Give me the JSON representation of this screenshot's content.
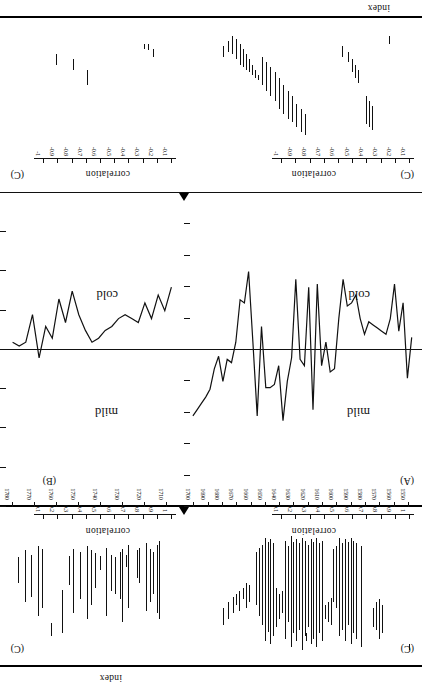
{
  "figure": {
    "orientation": "rotated-180",
    "panels": [
      {
        "id": "A",
        "label": "(A)"
      },
      {
        "id": "B",
        "label": "(B)"
      },
      {
        "id": "C1",
        "label": "(C)"
      },
      {
        "id": "C2",
        "label": "(C)"
      },
      {
        "id": "C3",
        "label": "(C)"
      },
      {
        "id": "C4",
        "label": "(C)"
      }
    ]
  },
  "axes": {
    "index_name": "index",
    "correlation_name": "correlation",
    "index_ticks": [
      "1",
      "0.8",
      "0.6",
      "0.4",
      "0.2",
      "0",
      "-0.2",
      "-0.4",
      "-0.6",
      "-0.8",
      "-1"
    ],
    "index_ticks_b": [
      "8",
      "6",
      "4",
      "2",
      "0",
      "-2",
      "-4",
      "-6",
      "-8"
    ],
    "corr_pos_ticks": [
      "1",
      "0.9",
      "0.8",
      "0.7",
      "0.6",
      "0.5",
      "0.4",
      "0.3",
      "0.2",
      "0.1"
    ],
    "corr_neg_ticks": [
      "-0.1",
      "-0.2",
      "-0.3",
      "-0.4",
      "-0.5",
      "-0.6",
      "-0.7",
      "-0.8",
      "-0.9",
      "-1"
    ],
    "years_a": [
      "1550",
      "1560",
      "1570",
      "1580",
      "1590",
      "1600",
      "1610",
      "1620",
      "1630",
      "1640",
      "1650",
      "1660",
      "1670",
      "1680",
      "1690",
      "1700"
    ],
    "years_b": [
      "1710",
      "1720",
      "1730",
      "1740",
      "1750",
      "1760",
      "1770",
      "1780"
    ]
  },
  "annotations": {
    "mild": "mild",
    "cold": "cold"
  },
  "chart_data": {
    "type": "line",
    "title": "",
    "xlabel": "year",
    "ylabel": "index",
    "grid": false,
    "legend": "none",
    "panels": [
      {
        "id": "A",
        "label": "(A)",
        "xlim": [
          1545,
          1703
        ],
        "ylim": [
          -1,
          1
        ],
        "ylabel": "index",
        "yticks": [
          1,
          0.8,
          0.6,
          0.4,
          0.2,
          0,
          -0.2,
          -0.4,
          -0.6,
          -0.8,
          -1
        ],
        "xticks": [
          1550,
          1560,
          1570,
          1580,
          1590,
          1600,
          1610,
          1620,
          1630,
          1640,
          1650,
          1660,
          1670,
          1680,
          1690,
          1700
        ],
        "zones": {
          "above_zero": "mild",
          "below_zero": "cold"
        },
        "x": [
          1548,
          1551,
          1554,
          1557,
          1560,
          1563,
          1566,
          1569,
          1572,
          1575,
          1578,
          1581,
          1584,
          1587,
          1590,
          1593,
          1596,
          1599,
          1602,
          1605,
          1608,
          1611,
          1614,
          1617,
          1620,
          1623,
          1626,
          1629,
          1632,
          1635,
          1638,
          1641,
          1644,
          1647,
          1650,
          1653,
          1656,
          1659,
          1662,
          1665,
          1668,
          1671,
          1674,
          1677,
          1680,
          1683,
          1686,
          1689,
          1692,
          1695,
          1698,
          1701
        ],
        "y": [
          -0.08,
          0.18,
          -0.3,
          -0.12,
          -0.42,
          -0.2,
          -0.1,
          -0.12,
          -0.14,
          -0.16,
          -0.18,
          -0.1,
          -0.2,
          -0.35,
          -0.3,
          -0.28,
          -0.45,
          -0.2,
          0.12,
          0.14,
          -0.05,
          0.1,
          -0.42,
          0.38,
          -0.4,
          0.1,
          0.06,
          -0.45,
          0.05,
          0.2,
          0.45,
          0.1,
          0.22,
          0.24,
          0.24,
          -0.15,
          0.42,
          -0.05,
          -0.5,
          -0.3,
          -0.32,
          -0.05,
          0.08,
          0.06,
          0.2,
          0.04,
          0.12,
          0.25,
          0.3,
          0.34,
          0.38,
          0.42
        ]
      },
      {
        "id": "B",
        "label": "(B)",
        "xlim": [
          1705,
          1783
        ],
        "ylim": [
          -8,
          8
        ],
        "ylabel": "index",
        "yticks": [
          8,
          6,
          4,
          2,
          0,
          -2,
          -4,
          -6,
          -8
        ],
        "xticks": [
          1710,
          1720,
          1730,
          1740,
          1750,
          1760,
          1770,
          1780
        ],
        "zones": {
          "above_zero": "mild",
          "below_zero": "cold"
        },
        "x": [
          1708,
          1711,
          1714,
          1717,
          1720,
          1723,
          1726,
          1729,
          1732,
          1735,
          1738,
          1741,
          1744,
          1747,
          1750,
          1753,
          1756,
          1759,
          1762,
          1765,
          1768,
          1771,
          1774,
          1777,
          1780
        ],
        "y": [
          -3.2,
          -2.0,
          -2.8,
          -1.6,
          -2.4,
          -1.4,
          -1.6,
          -1.8,
          -1.6,
          -1.2,
          -1.0,
          -0.6,
          -0.4,
          -1.0,
          -1.8,
          -3.0,
          -1.4,
          -2.6,
          -0.6,
          -1.2,
          0.4,
          -1.8,
          -0.4,
          -0.2,
          -0.4
        ]
      },
      {
        "id": "C1",
        "label": "(C)",
        "desc": "positive correlation bars, years 1710-1780",
        "ylim": [
          0,
          1
        ],
        "yticks": [
          1,
          0.9,
          0.8,
          0.7,
          0.6,
          0.5,
          0.4,
          0.3,
          0.2,
          0.1
        ],
        "bars": [
          {
            "x": 1713,
            "lo": 0.14,
            "hi": 0.7
          },
          {
            "x": 1714,
            "lo": 0.17,
            "hi": 0.66
          },
          {
            "x": 1716,
            "lo": 0.22,
            "hi": 0.52
          },
          {
            "x": 1717,
            "lo": 0.2,
            "hi": 0.58
          },
          {
            "x": 1719,
            "lo": 0.16,
            "hi": 0.64
          },
          {
            "x": 1722,
            "lo": 0.19,
            "hi": 0.44
          },
          {
            "x": 1723,
            "lo": 0.21,
            "hi": 0.41
          },
          {
            "x": 1727,
            "lo": 0.17,
            "hi": 0.62
          },
          {
            "x": 1728,
            "lo": 0.24,
            "hi": 0.33
          },
          {
            "x": 1730,
            "lo": 0.2,
            "hi": 0.72
          },
          {
            "x": 1731,
            "lo": 0.22,
            "hi": 0.56
          },
          {
            "x": 1733,
            "lo": 0.26,
            "hi": 0.52
          },
          {
            "x": 1735,
            "lo": 0.24,
            "hi": 0.5
          },
          {
            "x": 1737,
            "lo": 0.19,
            "hi": 0.68
          },
          {
            "x": 1740,
            "lo": 0.25,
            "hi": 0.35
          },
          {
            "x": 1742,
            "lo": 0.23,
            "hi": 0.48
          },
          {
            "x": 1744,
            "lo": 0.21,
            "hi": 0.6
          },
          {
            "x": 1746,
            "lo": 0.18,
            "hi": 0.7
          },
          {
            "x": 1749,
            "lo": 0.22,
            "hi": 0.56
          },
          {
            "x": 1752,
            "lo": 0.2,
            "hi": 0.66
          },
          {
            "x": 1754,
            "lo": 0.25,
            "hi": 0.46
          },
          {
            "x": 1757,
            "lo": 0.49,
            "hi": 0.8
          },
          {
            "x": 1762,
            "lo": 0.73,
            "hi": 0.82
          },
          {
            "x": 1766,
            "lo": 0.2,
            "hi": 0.62
          },
          {
            "x": 1768,
            "lo": 0.18,
            "hi": 0.68
          },
          {
            "x": 1771,
            "lo": 0.24,
            "hi": 0.54
          },
          {
            "x": 1774,
            "lo": 0.21,
            "hi": 0.58
          },
          {
            "x": 1777,
            "lo": 0.26,
            "hi": 0.44
          }
        ]
      },
      {
        "id": "C2",
        "label": "(C)",
        "desc": "negative correlation bars, years 1710-1780",
        "ylim": [
          -1,
          0
        ],
        "yticks": [
          -0.1,
          -0.2,
          -0.3,
          -0.4,
          -0.5,
          -0.6,
          -0.7,
          -0.8,
          -0.9,
          -1
        ],
        "bars": [
          {
            "x": 1716,
            "lo": -0.8,
            "hi": -0.74
          },
          {
            "x": 1718,
            "lo": -0.84,
            "hi": -0.79
          },
          {
            "x": 1720,
            "lo": -0.84,
            "hi": -0.8
          },
          {
            "x": 1746,
            "lo": -0.64,
            "hi": -0.52
          },
          {
            "x": 1752,
            "lo": -0.72,
            "hi": -0.64
          },
          {
            "x": 1760,
            "lo": -0.76,
            "hi": -0.68
          }
        ]
      },
      {
        "id": "C3",
        "label": "(C)",
        "desc": "positive correlation bars, years 1550-1700 (dense band 1585-1655)",
        "ylim": [
          0,
          1
        ],
        "yticks": [
          1,
          0.9,
          0.8,
          0.7,
          0.6,
          0.5,
          0.4,
          0.3,
          0.2,
          0.1
        ],
        "bars": [
          {
            "x": 1549,
            "lo": 0.88,
            "hi": 0.92
          },
          {
            "x": 1568,
            "lo": 0.6,
            "hi": 0.8
          },
          {
            "x": 1570,
            "lo": 0.56,
            "hi": 0.84
          },
          {
            "x": 1572,
            "lo": 0.58,
            "hi": 0.78
          },
          {
            "x": 1574,
            "lo": 0.62,
            "hi": 0.76
          },
          {
            "x": 1583,
            "lo": 0.18,
            "hi": 0.9
          },
          {
            "x": 1586,
            "lo": 0.16,
            "hi": 0.84
          },
          {
            "x": 1588,
            "lo": 0.14,
            "hi": 0.8
          },
          {
            "x": 1590,
            "lo": 0.12,
            "hi": 0.88
          },
          {
            "x": 1592,
            "lo": 0.15,
            "hi": 0.74
          },
          {
            "x": 1594,
            "lo": 0.13,
            "hi": 0.86
          },
          {
            "x": 1596,
            "lo": 0.16,
            "hi": 0.78
          },
          {
            "x": 1598,
            "lo": 0.12,
            "hi": 0.82
          },
          {
            "x": 1600,
            "lo": 0.18,
            "hi": 0.62
          },
          {
            "x": 1602,
            "lo": 0.2,
            "hi": 0.58
          },
          {
            "x": 1604,
            "lo": 0.55,
            "hi": 0.74
          },
          {
            "x": 1606,
            "lo": 0.58,
            "hi": 0.72
          },
          {
            "x": 1608,
            "lo": 0.6,
            "hi": 0.7
          },
          {
            "x": 1610,
            "lo": 0.14,
            "hi": 0.86
          },
          {
            "x": 1612,
            "lo": 0.16,
            "hi": 0.8
          },
          {
            "x": 1614,
            "lo": 0.12,
            "hi": 0.9
          },
          {
            "x": 1616,
            "lo": 0.15,
            "hi": 0.84
          },
          {
            "x": 1618,
            "lo": 0.13,
            "hi": 0.88
          },
          {
            "x": 1620,
            "lo": 0.17,
            "hi": 0.76
          },
          {
            "x": 1621,
            "lo": 0.8,
            "hi": 0.86
          },
          {
            "x": 1622,
            "lo": 0.14,
            "hi": 0.82
          },
          {
            "x": 1624,
            "lo": 0.12,
            "hi": 0.92
          },
          {
            "x": 1626,
            "lo": 0.16,
            "hi": 0.78
          },
          {
            "x": 1628,
            "lo": 0.13,
            "hi": 0.86
          },
          {
            "x": 1630,
            "lo": 0.15,
            "hi": 0.8
          },
          {
            "x": 1632,
            "lo": 0.11,
            "hi": 0.9
          },
          {
            "x": 1634,
            "lo": 0.18,
            "hi": 0.72
          },
          {
            "x": 1636,
            "lo": 0.14,
            "hi": 0.84
          },
          {
            "x": 1638,
            "lo": 0.5,
            "hi": 0.66
          },
          {
            "x": 1640,
            "lo": 0.52,
            "hi": 0.7
          },
          {
            "x": 1642,
            "lo": 0.48,
            "hi": 0.76
          },
          {
            "x": 1644,
            "lo": 0.16,
            "hi": 0.82
          },
          {
            "x": 1646,
            "lo": 0.13,
            "hi": 0.88
          },
          {
            "x": 1648,
            "lo": 0.15,
            "hi": 0.79
          },
          {
            "x": 1650,
            "lo": 0.12,
            "hi": 0.86
          },
          {
            "x": 1652,
            "lo": 0.17,
            "hi": 0.74
          },
          {
            "x": 1654,
            "lo": 0.19,
            "hi": 0.68
          },
          {
            "x": 1656,
            "lo": 0.22,
            "hi": 0.6
          },
          {
            "x": 1661,
            "lo": 0.46,
            "hi": 0.58
          },
          {
            "x": 1663,
            "lo": 0.44,
            "hi": 0.62
          },
          {
            "x": 1665,
            "lo": 0.48,
            "hi": 0.56
          },
          {
            "x": 1668,
            "lo": 0.5,
            "hi": 0.64
          },
          {
            "x": 1670,
            "lo": 0.52,
            "hi": 0.6
          },
          {
            "x": 1672,
            "lo": 0.54,
            "hi": 0.66
          },
          {
            "x": 1676,
            "lo": 0.58,
            "hi": 0.7
          },
          {
            "x": 1679,
            "lo": 0.62,
            "hi": 0.74
          }
        ]
      },
      {
        "id": "C4",
        "label": "(C)",
        "desc": "negative correlation bars, years 1550-1700",
        "ylim": [
          -1,
          0
        ],
        "yticks": [
          -0.1,
          -0.2,
          -0.3,
          -0.4,
          -0.5,
          -0.6,
          -0.7,
          -0.8,
          -0.9,
          -1
        ],
        "bars": [
          {
            "x": 1563,
            "lo": -0.9,
            "hi": -0.84
          },
          {
            "x": 1575,
            "lo": -0.36,
            "hi": -0.18
          },
          {
            "x": 1577,
            "lo": -0.4,
            "hi": -0.2
          },
          {
            "x": 1579,
            "lo": -0.44,
            "hi": -0.22
          },
          {
            "x": 1585,
            "lo": -0.64,
            "hi": -0.54
          },
          {
            "x": 1587,
            "lo": -0.68,
            "hi": -0.58
          },
          {
            "x": 1589,
            "lo": -0.72,
            "hi": -0.62
          },
          {
            "x": 1592,
            "lo": -0.78,
            "hi": -0.7
          },
          {
            "x": 1596,
            "lo": -0.82,
            "hi": -0.74
          },
          {
            "x": 1622,
            "lo": -0.3,
            "hi": -0.14
          },
          {
            "x": 1625,
            "lo": -0.34,
            "hi": -0.16
          },
          {
            "x": 1628,
            "lo": -0.38,
            "hi": -0.2
          },
          {
            "x": 1631,
            "lo": -0.44,
            "hi": -0.24
          },
          {
            "x": 1634,
            "lo": -0.48,
            "hi": -0.26
          },
          {
            "x": 1637,
            "lo": -0.52,
            "hi": -0.3
          },
          {
            "x": 1640,
            "lo": -0.58,
            "hi": -0.34
          },
          {
            "x": 1643,
            "lo": -0.62,
            "hi": -0.4
          },
          {
            "x": 1646,
            "lo": -0.66,
            "hi": -0.44
          },
          {
            "x": 1649,
            "lo": -0.7,
            "hi": -0.48
          },
          {
            "x": 1652,
            "lo": -0.74,
            "hi": -0.52
          },
          {
            "x": 1655,
            "lo": -0.6,
            "hi": -0.56
          },
          {
            "x": 1657,
            "lo": -0.64,
            "hi": -0.58
          },
          {
            "x": 1659,
            "lo": -0.68,
            "hi": -0.6
          },
          {
            "x": 1661,
            "lo": -0.72,
            "hi": -0.62
          },
          {
            "x": 1663,
            "lo": -0.76,
            "hi": -0.64
          },
          {
            "x": 1665,
            "lo": -0.8,
            "hi": -0.66
          },
          {
            "x": 1667,
            "lo": -0.84,
            "hi": -0.68
          },
          {
            "x": 1670,
            "lo": -0.88,
            "hi": -0.72
          },
          {
            "x": 1673,
            "lo": -0.9,
            "hi": -0.76
          },
          {
            "x": 1676,
            "lo": -0.86,
            "hi": -0.78
          },
          {
            "x": 1679,
            "lo": -0.82,
            "hi": -0.74
          }
        ]
      }
    ]
  }
}
